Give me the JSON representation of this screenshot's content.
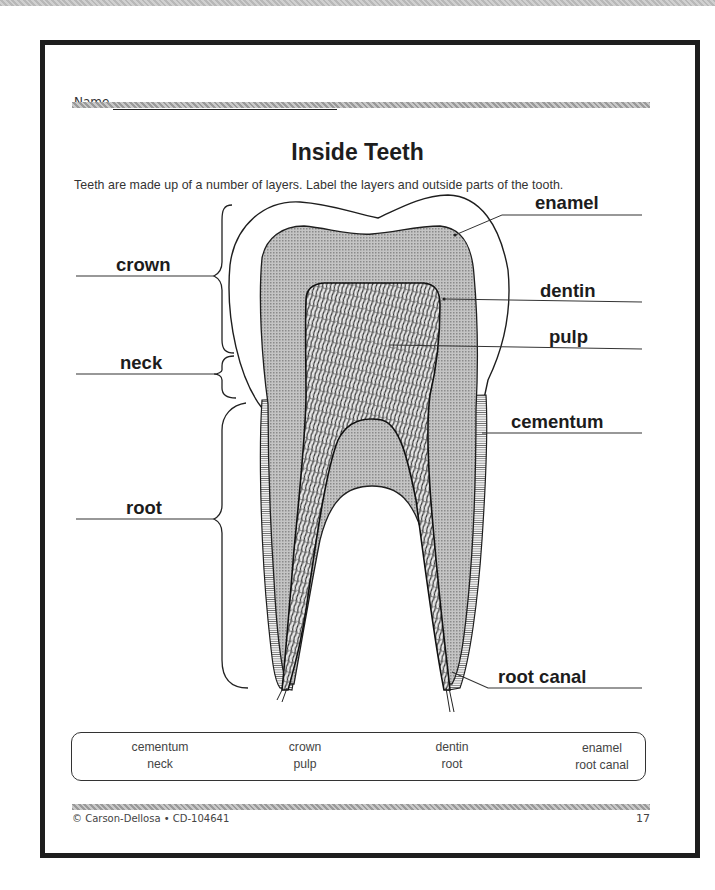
{
  "worksheet": {
    "name_label": "Name",
    "title": "Inside Teeth",
    "instructions": "Teeth are made up of a number of layers. Label the layers and outside parts of the tooth."
  },
  "diagram": {
    "left_labels": [
      {
        "text": "crown",
        "line_y": 276
      },
      {
        "text": "neck",
        "line_y": 374
      },
      {
        "text": "root",
        "line_y": 519
      }
    ],
    "right_labels": [
      {
        "text": "enamel",
        "line_y": 215
      },
      {
        "text": "dentin",
        "line_y": 302
      },
      {
        "text": "pulp",
        "line_y": 349
      },
      {
        "text": "cementum",
        "line_y": 433
      },
      {
        "text": "root canal",
        "line_y": 688
      }
    ],
    "colors": {
      "dentin_fill": "#b4b4b4",
      "outline": "#1e1e1e",
      "enamel_fill": "#ffffff"
    }
  },
  "word_bank": {
    "row1": [
      "cementum",
      "crown",
      "dentin",
      "enamel"
    ],
    "row2": [
      "neck",
      "pulp",
      "root",
      "root canal"
    ]
  },
  "footer": {
    "copyright": "© Carson-Dellosa • CD-104641",
    "page_number": "17"
  }
}
